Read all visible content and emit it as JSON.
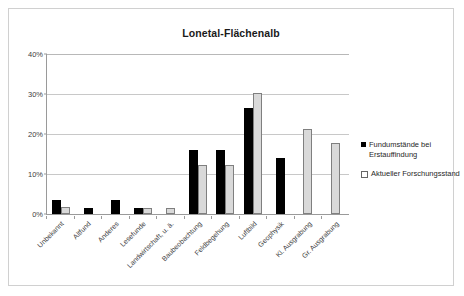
{
  "chart_data": {
    "type": "bar",
    "title": "Lonetal-Flächenalb",
    "xlabel": "",
    "ylabel": "",
    "ylim": [
      0,
      40
    ],
    "ytick_labels": [
      "0%",
      "10%",
      "20%",
      "30%",
      "40%"
    ],
    "ytick_values": [
      0,
      10,
      20,
      30,
      40
    ],
    "grid": true,
    "legend_position": "right",
    "categories": [
      "Unbekannt",
      "Altfund",
      "Anderes",
      "Lesefunde",
      "Landwirtschaft, u. ä.",
      "Baubeobachtung",
      "Feldbegehung",
      "Luftbild",
      "Geophysik",
      "Kl. Ausgrabung",
      "Gr. Ausgrabung"
    ],
    "series": [
      {
        "name": "Fundumstände bei Erstauffindung",
        "color": "#000000",
        "values": [
          3.4,
          1.5,
          3.4,
          1.5,
          0,
          15.9,
          15.9,
          26.6,
          14.0,
          0,
          0
        ]
      },
      {
        "name": "Aktueller Forschungsstand",
        "color": "#d9d9d9",
        "values": [
          1.7,
          0,
          0,
          1.6,
          1.6,
          12.3,
          12.3,
          30.2,
          0,
          21.3,
          17.8
        ]
      }
    ]
  },
  "legend": {
    "items": [
      {
        "label": "Fundumstände bei Erstauffindung",
        "swatch": "filled-black-square"
      },
      {
        "label": "Aktueller Forschungsstand",
        "swatch": "outlined-white-square"
      }
    ]
  }
}
